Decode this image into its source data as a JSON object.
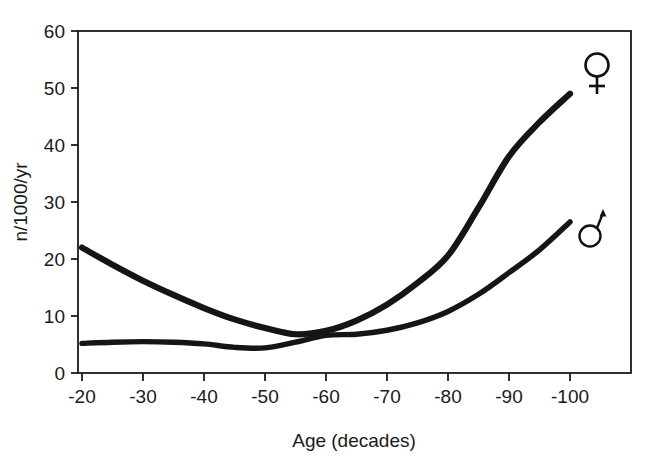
{
  "chart_data": {
    "type": "line",
    "title": "",
    "xlabel": "Age (decades)",
    "ylabel": "n/1000/yr",
    "xlim": [
      -20,
      -100
    ],
    "ylim": [
      0,
      60
    ],
    "xticks": [
      "-20",
      "-30",
      "-40",
      "-50",
      "-60",
      "-70",
      "-80",
      "-90",
      "-100"
    ],
    "yticks": [
      "0",
      "10",
      "20",
      "30",
      "40",
      "50",
      "60"
    ],
    "grid": false,
    "legend_position": "inline-right-end-markers",
    "x": [
      -20,
      -25,
      -30,
      -35,
      -40,
      -45,
      -50,
      -55,
      -60,
      -65,
      -70,
      -75,
      -80,
      -85,
      -90,
      -95,
      -100
    ],
    "series": [
      {
        "name": "female",
        "symbol": "♀",
        "marker_label": "female-symbol",
        "color": "#151515",
        "values": [
          22.0,
          19.0,
          16.2,
          13.7,
          11.4,
          9.4,
          7.9,
          6.8,
          7.4,
          9.2,
          12.0,
          15.8,
          20.6,
          29.0,
          38.0,
          44.0,
          49.0
        ]
      },
      {
        "name": "male",
        "symbol": "♂",
        "marker_label": "male-symbol",
        "color": "#2a2a2a",
        "values": [
          5.2,
          5.4,
          5.5,
          5.4,
          5.1,
          4.5,
          4.4,
          5.4,
          6.6,
          6.8,
          7.5,
          8.8,
          10.8,
          13.8,
          17.6,
          21.6,
          26.5
        ]
      }
    ],
    "annotations": [
      {
        "name": "female-end-marker",
        "symbol": "♀",
        "x": -100,
        "y": 53.5
      },
      {
        "name": "male-end-marker",
        "symbol": "♂",
        "x": -100,
        "y": 30.0
      }
    ]
  },
  "axis": {
    "x_title": "Age (decades)",
    "y_title": "n/1000/yr"
  },
  "colors": {
    "line_female": "#151515",
    "line_male": "#2a2a2a",
    "axis": "#1a1a1a",
    "background": "#ffffff"
  }
}
